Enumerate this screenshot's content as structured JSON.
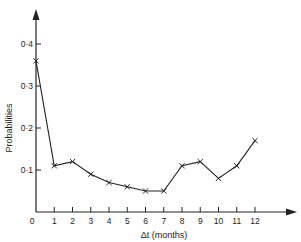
{
  "chart_data": {
    "type": "line",
    "title": "",
    "xlabel": "Δt (months)",
    "ylabel": "Probabilities",
    "x": [
      0,
      1,
      2,
      3,
      4,
      5,
      6,
      7,
      8,
      9,
      10,
      11,
      12
    ],
    "series": [
      {
        "name": "Probabilities",
        "marker": "x",
        "values": [
          0.36,
          0.11,
          0.12,
          0.09,
          0.07,
          0.06,
          0.05,
          0.05,
          0.11,
          0.12,
          0.08,
          0.11,
          0.17
        ]
      }
    ],
    "x_ticks": [
      "0",
      "1",
      "2",
      "3",
      "4",
      "5",
      "6",
      "7",
      "8",
      "9",
      "10",
      "11",
      "12"
    ],
    "y_ticks": [
      "0·1",
      "0·2",
      "0·3",
      "0·4"
    ],
    "xlim": [
      0,
      14
    ],
    "ylim": [
      0,
      0.45
    ],
    "grid": false,
    "legend": "none"
  },
  "colors": {
    "ink": "#222222",
    "background": "#ffffff"
  }
}
